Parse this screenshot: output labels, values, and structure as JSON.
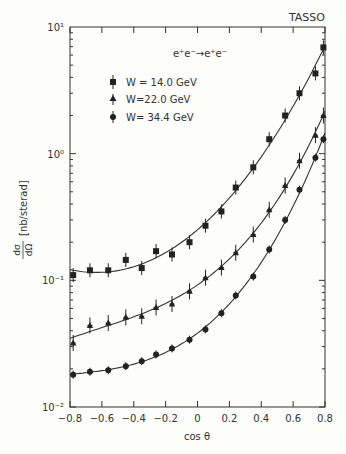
{
  "header": {
    "corner_text": "TASSO",
    "experiment_label": "TASSO",
    "process_label": "e⁺e⁻→e⁺e⁻"
  },
  "chart_data": {
    "type": "scatter",
    "title": "",
    "experiment": "TASSO",
    "annotation": "e+e- → e+e-",
    "xlabel": "cos θ",
    "ylabel": "dσ/dΩ [nb/sterad]",
    "xlim": [
      -0.8,
      0.8
    ],
    "ylim": [
      0.01,
      10
    ],
    "yscale": "log",
    "grid": false,
    "legend_position": "upper-left",
    "x_ticks": [
      -0.8,
      -0.6,
      -0.4,
      -0.2,
      0,
      0.2,
      0.4,
      0.6,
      0.8
    ],
    "x_tick_labels": [
      "-0.8",
      "-0.6",
      "-0.4",
      "-0.2",
      "0",
      "0.2",
      "0.4",
      "0.6",
      "0.8"
    ],
    "y_ticks": [
      0.01,
      0.1,
      1,
      10
    ],
    "y_tick_labels": [
      "10⁻²",
      "10⁻¹",
      "10⁰",
      "10¹"
    ],
    "x": [
      -0.78,
      -0.675,
      -0.56,
      -0.45,
      -0.35,
      -0.26,
      -0.16,
      -0.05,
      0.05,
      0.15,
      0.24,
      0.35,
      0.45,
      0.55,
      0.64,
      0.74,
      0.79
    ],
    "series": [
      {
        "name": "W = 14.0 GeV",
        "marker": "square",
        "values": [
          0.11,
          0.12,
          0.12,
          0.145,
          0.125,
          0.17,
          0.16,
          0.2,
          0.27,
          0.35,
          0.54,
          0.78,
          1.3,
          2.0,
          3.0,
          4.3,
          6.9
        ],
        "fit_curve": true
      },
      {
        "name": "W = 22.0 GeV",
        "marker": "triangle",
        "values": [
          0.032,
          0.044,
          0.046,
          0.051,
          0.052,
          0.061,
          0.065,
          0.082,
          0.105,
          0.126,
          0.165,
          0.23,
          0.36,
          0.56,
          0.88,
          1.4,
          2.0
        ],
        "fit_curve": true
      },
      {
        "name": "W = 34.4 GeV",
        "marker": "circle",
        "values": [
          0.018,
          0.019,
          0.0195,
          0.021,
          0.023,
          0.026,
          0.029,
          0.034,
          0.041,
          0.055,
          0.076,
          0.107,
          0.175,
          0.3,
          0.52,
          0.93,
          1.3
        ],
        "fit_curve": true
      }
    ]
  },
  "legend": {
    "items": [
      {
        "label": "W = 14.0 GeV",
        "marker": "square"
      },
      {
        "label": "W=22.0 GeV",
        "marker": "triangle"
      },
      {
        "label": "W= 34.4 GeV",
        "marker": "circle"
      }
    ]
  },
  "axes": {
    "xlabel": "cos θ",
    "ylabel_fraction_num": "dσ",
    "ylabel_fraction_den": "dΩ",
    "ylabel_units": "[nb/sterad]"
  },
  "colors": {
    "ink": "#2a2a2a",
    "background": "#fdfdfb"
  }
}
